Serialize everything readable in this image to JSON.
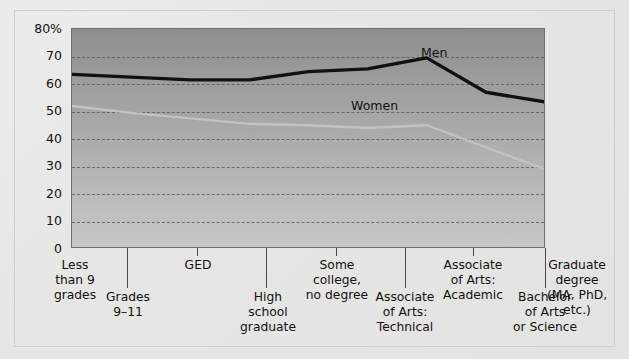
{
  "chart_data": {
    "type": "line",
    "title": "",
    "subtitle": "",
    "xlabel": "",
    "ylabel": "",
    "ylim": [
      0,
      80
    ],
    "grid": true,
    "legend_position": "inline-annotation",
    "ytick_labels": [
      "80%",
      "70",
      "60",
      "50",
      "40",
      "30",
      "20",
      "10",
      "0"
    ],
    "ytick_values": [
      80,
      70,
      60,
      50,
      40,
      30,
      20,
      10,
      0
    ],
    "categories": [
      "Less than 9 grades",
      "Grades 9–11",
      "GED",
      "High school graduate",
      "Some college, no degree",
      "Associate of Arts: Technical",
      "Associate of Arts: Academic",
      "Bachelor of Arts or Science",
      "Graduate degree (MA, PhD, etc.)"
    ],
    "series": [
      {
        "name": "Men",
        "color": "#111111",
        "values": [
          63.5,
          62.5,
          61.5,
          61.5,
          64.5,
          65.5,
          69.5,
          57.0,
          53.5
        ]
      },
      {
        "name": "Women",
        "color": "#c2c2c2",
        "values": [
          52.0,
          49.5,
          47.5,
          45.5,
          45.0,
          44.0,
          45.0,
          37.0,
          29.0
        ]
      }
    ],
    "annotations": [
      {
        "text": "Men",
        "series": "Men"
      },
      {
        "text": "Women",
        "series": "Women"
      }
    ]
  },
  "yaxis": {
    "ticks": [
      {
        "label": "80%"
      },
      {
        "label": "70"
      },
      {
        "label": "60"
      },
      {
        "label": "50"
      },
      {
        "label": "40"
      },
      {
        "label": "30"
      },
      {
        "label": "20"
      },
      {
        "label": "10"
      },
      {
        "label": "0"
      }
    ]
  },
  "xaxis": {
    "labels": [
      {
        "lines": [
          "Less",
          "than 9",
          "grades"
        ],
        "row": "top"
      },
      {
        "lines": [
          "Grades",
          "9–11"
        ],
        "row": "bottom"
      },
      {
        "lines": [
          "GED"
        ],
        "row": "top"
      },
      {
        "lines": [
          "High",
          "school",
          "graduate"
        ],
        "row": "bottom"
      },
      {
        "lines": [
          "Some",
          "college,",
          "no degree"
        ],
        "row": "top"
      },
      {
        "lines": [
          "Associate",
          "of Arts:",
          "Technical"
        ],
        "row": "bottom"
      },
      {
        "lines": [
          "Associate",
          "of Arts:",
          "Academic"
        ],
        "row": "top"
      },
      {
        "lines": [
          "Bachelor",
          "of Arts",
          "or Science"
        ],
        "row": "bottom"
      },
      {
        "lines": [
          "Graduate",
          "degree",
          "(MA, PhD,",
          "etc.)"
        ],
        "row": "top"
      }
    ]
  },
  "series_labels": {
    "men": "Men",
    "women": "Women"
  },
  "colors": {
    "men_line": "#111111",
    "women_line": "#c2c2c2",
    "plot_top": "#8e8e8e",
    "plot_bottom": "#c7c7c7",
    "gridline": "#5e5e5e",
    "page_background": "#e8e8e6"
  }
}
